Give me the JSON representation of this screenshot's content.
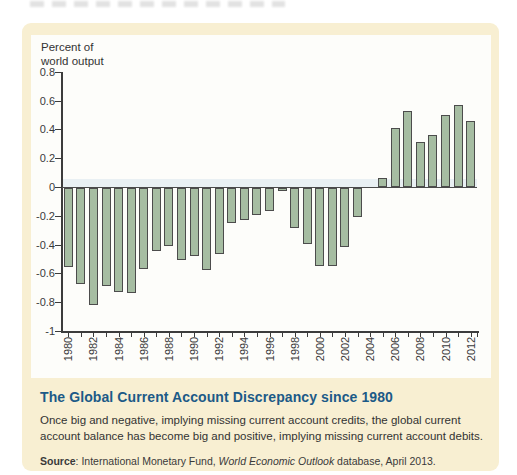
{
  "figure": {
    "card_bg": "#f8efd2",
    "panel_bg": "#fdfdfa"
  },
  "chart_data": {
    "type": "bar",
    "title": "",
    "xlabel": "",
    "ylabel": "Percent of world output",
    "ylabel_lines": [
      "Percent of",
      "world output"
    ],
    "ylim": [
      -1,
      0.8
    ],
    "grid": false,
    "legend": "none",
    "x_labels_rotated": true,
    "x_label_every": 2,
    "bar_color": "#a6bda2",
    "bar_border_color": "#4c4c4c",
    "axis_color": "#3c3c3c",
    "y_ticks": {
      "labels": [
        "0.8",
        "0.6",
        "0.4",
        "0.2",
        "0",
        "-0.2",
        "-0.4",
        "-0.6",
        "-0.8",
        "-1"
      ],
      "values": [
        0.8,
        0.6,
        0.4,
        0.2,
        0,
        -0.2,
        -0.4,
        -0.6,
        -0.8,
        -1
      ]
    },
    "years": [
      1980,
      1981,
      1982,
      1983,
      1984,
      1985,
      1986,
      1987,
      1988,
      1989,
      1990,
      1991,
      1992,
      1993,
      1994,
      1995,
      1996,
      1997,
      1998,
      1999,
      2000,
      2001,
      2002,
      2003,
      2004,
      2005,
      2006,
      2007,
      2008,
      2009,
      2010,
      2011,
      2012
    ],
    "values": [
      -0.55,
      -0.67,
      -0.81,
      -0.68,
      -0.72,
      -0.73,
      -0.56,
      -0.44,
      -0.4,
      -0.5,
      -0.47,
      -0.57,
      -0.46,
      -0.24,
      -0.22,
      -0.19,
      -0.16,
      -0.02,
      -0.28,
      -0.39,
      -0.54,
      -0.54,
      -0.41,
      -0.2,
      0.0,
      0.06,
      0.41,
      0.53,
      0.31,
      0.36,
      0.5,
      0.57,
      0.46
    ]
  },
  "caption": {
    "title": "The Global Current Account Discrepancy since 1980",
    "title_color": "#1c5a87",
    "body": "Once big and negative, implying missing current account credits, the global current account balance has become big and positive, implying missing current account debits."
  },
  "source": {
    "label": "Source",
    "after_label": ": International Monetary Fund, ",
    "italic": "World Economic Outlook",
    "post": " database, April 2013."
  }
}
